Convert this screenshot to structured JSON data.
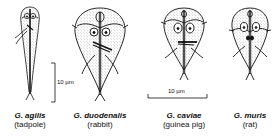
{
  "figure": {
    "organisms": [
      {
        "species": "G. agilis",
        "host": "(tadpole)"
      },
      {
        "species": "G. duodenalis",
        "host": "(rabbit)"
      },
      {
        "species": "G. caviae",
        "host": "(guinea pig)"
      },
      {
        "species": "G. muris",
        "host": "(rat)"
      }
    ],
    "scale_bars": [
      {
        "orientation": "vertical",
        "label": "10 µm"
      },
      {
        "orientation": "horizontal",
        "label": "10 µm"
      }
    ],
    "colors": {
      "ink": "#111111",
      "stipple": "#555555",
      "background": "#ffffff"
    }
  }
}
